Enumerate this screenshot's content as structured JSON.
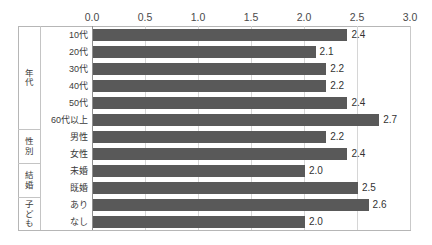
{
  "chart_data": {
    "type": "bar",
    "orientation": "horizontal",
    "title": "",
    "xlabel": "",
    "ylabel": "",
    "xlim": [
      0.0,
      3.0
    ],
    "grid": true,
    "legend": "none",
    "tick_labels": [
      "0.0",
      "0.5",
      "1.0",
      "1.5",
      "2.0",
      "2.5",
      "3.0"
    ],
    "tick_values": [
      0.0,
      0.5,
      1.0,
      1.5,
      2.0,
      2.5,
      3.0
    ],
    "groups": [
      {
        "name": "年代",
        "categories": [
          "10代",
          "20代",
          "30代",
          "40代",
          "50代",
          "60代以上"
        ],
        "values": [
          2.4,
          2.1,
          2.2,
          2.2,
          2.4,
          2.7
        ],
        "value_labels": [
          "2.4",
          "2.1",
          "2.2",
          "2.2",
          "2.4",
          "2.7"
        ]
      },
      {
        "name": "性別",
        "categories": [
          "男性",
          "女性"
        ],
        "values": [
          2.2,
          2.4
        ],
        "value_labels": [
          "2.2",
          "2.4"
        ]
      },
      {
        "name": "結婚",
        "categories": [
          "未婚",
          "既婚"
        ],
        "values": [
          2.0,
          2.5
        ],
        "value_labels": [
          "2.0",
          "2.5"
        ]
      },
      {
        "name": "子ども",
        "categories": [
          "あり",
          "なし"
        ],
        "values": [
          2.6,
          2.0
        ],
        "value_labels": [
          "2.6",
          "2.0"
        ]
      }
    ],
    "categories": [
      "10代",
      "20代",
      "30代",
      "40代",
      "50代",
      "60代以上",
      "男性",
      "女性",
      "未婚",
      "既婚",
      "あり",
      "なし"
    ],
    "values": [
      2.4,
      2.1,
      2.2,
      2.2,
      2.4,
      2.7,
      2.2,
      2.4,
      2.0,
      2.5,
      2.6,
      2.0
    ]
  },
  "colors": {
    "bar": "#595959",
    "gridline": "#d6d6d6",
    "axis": "#8f8f8f",
    "frame": "#b6b6b6",
    "text": "#3b3b3b",
    "background": "#ffffff"
  }
}
